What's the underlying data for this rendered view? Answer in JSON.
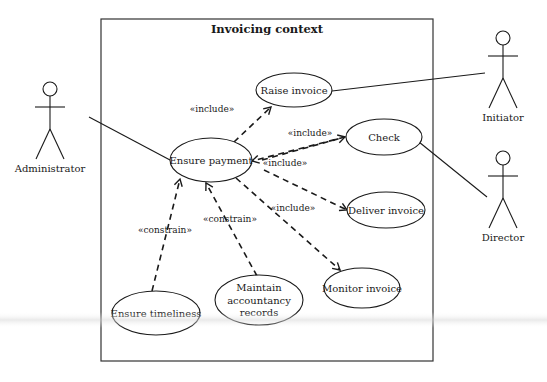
{
  "diagram": {
    "type": "UML use case diagram",
    "colors": {
      "stroke": "#1a1a1a",
      "frame": "#333333",
      "background": "#ffffff"
    },
    "frame": {
      "title": "Invoicing context",
      "x": 101,
      "y": 19,
      "width": 332,
      "height": 342
    },
    "actors": [
      {
        "id": "administrator",
        "label": "Administrator",
        "cx": 50,
        "head_y": 89
      },
      {
        "id": "initiator",
        "label": "Initiator",
        "cx": 503,
        "head_y": 38
      },
      {
        "id": "director",
        "label": "Director",
        "cx": 503,
        "head_y": 158
      }
    ],
    "use_cases": [
      {
        "id": "raise-invoice",
        "lines": [
          "Raise invoice"
        ],
        "cx": 294,
        "cy": 90,
        "rx": 38,
        "ry": 17
      },
      {
        "id": "ensure-payment",
        "lines": [
          "Ensure payment"
        ],
        "cx": 211,
        "cy": 160,
        "rx": 41,
        "ry": 22
      },
      {
        "id": "check",
        "lines": [
          "Check"
        ],
        "cx": 384,
        "cy": 137,
        "rx": 38,
        "ry": 18
      },
      {
        "id": "deliver-invoice",
        "lines": [
          "Deliver invoice"
        ],
        "cx": 386,
        "cy": 210,
        "rx": 39,
        "ry": 18
      },
      {
        "id": "monitor-invoice",
        "lines": [
          "Monitor invoice"
        ],
        "cx": 362,
        "cy": 288,
        "rx": 38,
        "ry": 20
      },
      {
        "id": "ensure-timeliness",
        "lines": [
          "Ensure timeliness"
        ],
        "cx": 156,
        "cy": 313,
        "rx": 44,
        "ry": 22
      },
      {
        "id": "maintain-accountancy-records",
        "lines": [
          "Maintain",
          "accountancy",
          "records"
        ],
        "cx": 259,
        "cy": 300,
        "rx": 44,
        "ry": 25
      }
    ],
    "associations": [
      {
        "actor": "administrator",
        "use_case": "ensure-payment",
        "x1": 89,
        "y1": 117,
        "x2": 170,
        "y2": 160
      },
      {
        "actor": "initiator",
        "use_case": "raise-invoice",
        "x1": 332,
        "y1": 91,
        "x2": 485,
        "y2": 73
      },
      {
        "actor": "director",
        "use_case": "check",
        "x1": 419,
        "y1": 142,
        "x2": 487,
        "y2": 197
      }
    ],
    "dependencies": [
      {
        "from": "ensure-payment",
        "to": "raise-invoice",
        "stereotype": "«include»",
        "x1": 234,
        "y1": 142,
        "x2": 271,
        "y2": 107,
        "label_x": 212,
        "label_y": 112
      },
      {
        "from": "ensure-payment",
        "to": "check",
        "stereotype": "«include»",
        "x1": 262,
        "y1": 160,
        "x2": 345,
        "y2": 137,
        "label_x": 310,
        "label_y": 136
      },
      {
        "from": "check",
        "to": "ensure-payment",
        "stereotype": "«include»",
        "x1": 345,
        "y1": 137,
        "x2": 252,
        "y2": 161,
        "label_x": 285,
        "label_y": 166,
        "note": "bidirectional arrowheads drawn"
      },
      {
        "from": "ensure-payment",
        "to": "deliver-invoice",
        "stereotype": "«include»",
        "x1": 264,
        "y1": 170,
        "x2": 347,
        "y2": 210
      },
      {
        "from": "ensure-payment",
        "to": "monitor-invoice",
        "stereotype": "«include»",
        "x1": 236,
        "y1": 178,
        "x2": 340,
        "y2": 270,
        "label_x": 293,
        "label_y": 211
      },
      {
        "from": "ensure-timeliness",
        "to": "ensure-payment",
        "stereotype": "«constrain»",
        "x1": 152,
        "y1": 291,
        "x2": 180,
        "y2": 179,
        "label_x": 165,
        "label_y": 233
      },
      {
        "from": "maintain-accountancy-records",
        "to": "ensure-payment",
        "stereotype": "«constrain»",
        "x1": 257,
        "y1": 276,
        "x2": 206,
        "y2": 183,
        "label_x": 230,
        "label_y": 222
      }
    ]
  }
}
